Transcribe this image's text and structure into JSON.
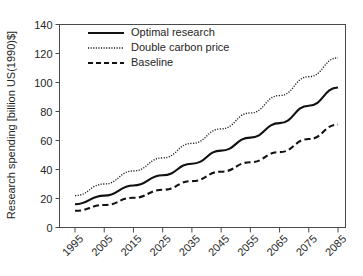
{
  "chart_data": {
    "type": "line",
    "title": "",
    "xlabel": "",
    "ylabel": "Research spending [billion US(1990)$]",
    "grid": false,
    "legend_position": "top-left",
    "xlim": [
      1995,
      2090
    ],
    "ylim": [
      0,
      140
    ],
    "x_tick_labels": [
      "1995",
      "2005",
      "2015",
      "2025",
      "2035",
      "2045",
      "2055",
      "2065",
      "2075",
      "2085"
    ],
    "x_tick_values": [
      1995,
      2005,
      2015,
      2025,
      2035,
      2045,
      2055,
      2065,
      2075,
      2085
    ],
    "y_tick_labels": [
      "0",
      "20",
      "40",
      "60",
      "80",
      "100",
      "120",
      "140"
    ],
    "y_tick_values": [
      0,
      20,
      40,
      60,
      80,
      100,
      120,
      140
    ],
    "x": [
      1995,
      2005,
      2015,
      2025,
      2035,
      2045,
      2055,
      2065,
      2075,
      2085
    ],
    "series": [
      {
        "name": "Optimal research",
        "style": "solid",
        "color": "#111111",
        "values": [
          16,
          22,
          29,
          36,
          44,
          53,
          62,
          72,
          84,
          96.5
        ]
      },
      {
        "name": "Double carbon price",
        "style": "dotted",
        "color": "#111111",
        "values": [
          22,
          30,
          39,
          48,
          58,
          68,
          79,
          91,
          104,
          117
        ]
      },
      {
        "name": "Baseline",
        "style": "dashed",
        "color": "#111111",
        "values": [
          11.5,
          15.5,
          20.5,
          26,
          32,
          38.5,
          45,
          52,
          61,
          71
        ]
      }
    ]
  },
  "legend": {
    "items": [
      {
        "label": "Optimal research",
        "style": "solid"
      },
      {
        "label": "Double carbon price",
        "style": "dotted"
      },
      {
        "label": "Baseline",
        "style": "dashed"
      }
    ]
  }
}
